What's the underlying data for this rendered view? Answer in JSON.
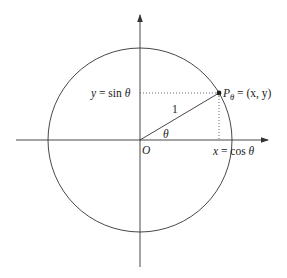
{
  "figure": {
    "type": "unit-circle",
    "labels": {
      "origin": "O",
      "radius": "1",
      "angle": "θ",
      "point": "P",
      "point_subscript": "θ",
      "point_coords": " = (x, y)",
      "y_proj_var": "y",
      "y_proj_rest": " = sin ",
      "y_proj_theta": "θ",
      "x_proj_var": "x",
      "x_proj_rest": " = cos ",
      "x_proj_theta": "θ"
    }
  },
  "colors": {
    "stroke": "#333333",
    "text": "#222222",
    "background": "#ffffff"
  }
}
